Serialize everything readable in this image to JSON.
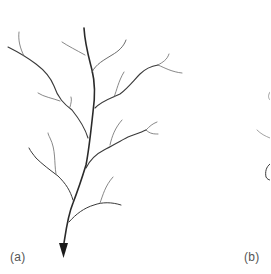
{
  "figure": {
    "panels": [
      {
        "id": "a",
        "label": "(a)",
        "description": "Dendritic branching network with a single outlet arrow pointing downward"
      },
      {
        "id": "b",
        "label": "(b)",
        "description": "Second panel, mostly cropped at the right edge"
      }
    ],
    "colors": {
      "stroke": "#3a3a3a",
      "thin_stroke": "#6a6a6a",
      "arrow": "#1a1a1a",
      "label": "#555555",
      "background": "#ffffff"
    },
    "icons": {
      "outlet": "arrow-down-icon"
    }
  }
}
